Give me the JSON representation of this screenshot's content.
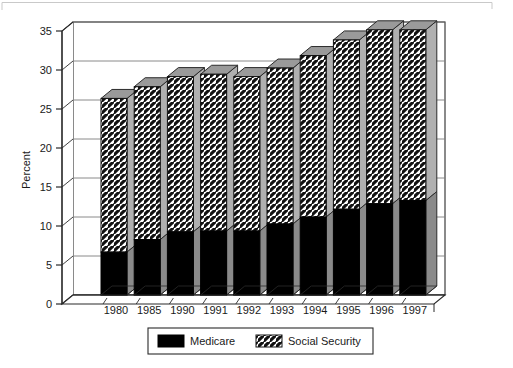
{
  "chart_data": {
    "type": "bar",
    "subtype": "stacked-3d-column",
    "title": "",
    "xlabel": "",
    "ylabel": "Percent",
    "ylim": [
      0,
      35
    ],
    "yticks": [
      0,
      5,
      10,
      15,
      20,
      25,
      30,
      35
    ],
    "ytick_labels": [
      "0",
      "5",
      "10",
      "15",
      "20",
      "25",
      "30",
      "35"
    ],
    "grid": true,
    "grid_axis": "y",
    "legend_position": "bottom",
    "categories": [
      "1980",
      "1985",
      "1990",
      "1991",
      "1992",
      "1993",
      "1994",
      "1995",
      "1996",
      "1997"
    ],
    "series": [
      {
        "name": "Medicare",
        "pattern": "solid",
        "color": "#000000",
        "values": [
          5.5,
          7.1,
          8.1,
          8.2,
          8.2,
          9.1,
          10.0,
          11.0,
          11.7,
          12.1
        ]
      },
      {
        "name": "Social Security",
        "pattern": "diagonal-hatch",
        "color": "#ffffff",
        "values": [
          19.7,
          19.6,
          19.9,
          20.1,
          19.8,
          20.0,
          20.7,
          21.7,
          22.3,
          21.9
        ]
      }
    ],
    "totals": [
      25.2,
      26.7,
      28.0,
      28.3,
      28.0,
      29.1,
      30.7,
      32.7,
      34.0,
      34.0
    ]
  },
  "axes": {
    "y_title": "Percent"
  },
  "legend": {
    "items": [
      {
        "label": "Medicare",
        "swatch": "solid-black-swatch"
      },
      {
        "label": "Social Security",
        "swatch": "hatched-swatch"
      }
    ]
  }
}
